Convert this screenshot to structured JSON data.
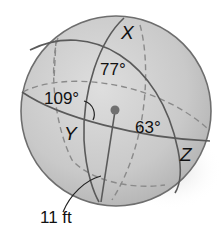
{
  "figure": {
    "type": "sphere with spherical triangle",
    "vertices": [
      {
        "id": "X",
        "label": "X"
      },
      {
        "id": "Y",
        "label": "Y"
      },
      {
        "id": "Z",
        "label": "Z"
      }
    ],
    "angles": [
      {
        "at": "X",
        "label": "77°"
      },
      {
        "at": "Y",
        "label": "109°"
      },
      {
        "at": "Z",
        "label": "63°"
      }
    ],
    "radius_label": "11 ft",
    "colors": {
      "sphere_fill": "#c8c8c8",
      "sphere_highlight": "#dcdcdc",
      "outline": "#6e6e6e",
      "great_circle": "#5a5a5a",
      "hidden_line": "#8a8a8a",
      "center_dot": "#707070",
      "text": "#111111"
    }
  }
}
